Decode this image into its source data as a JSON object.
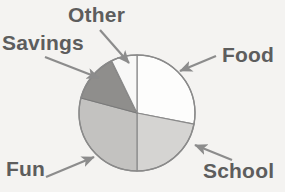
{
  "chart_data": {
    "type": "pie",
    "title": "",
    "subtitle": "",
    "xlabel": "",
    "ylabel": "",
    "grid": false,
    "legend_position": "none",
    "label_style": "external-with-arrows",
    "center": {
      "x": 137,
      "y": 113
    },
    "radius": 58,
    "start_angle_deg": 0,
    "direction": "clockwise",
    "categories": [
      "Food",
      "School",
      "Fun",
      "Savings",
      "Other"
    ],
    "values": [
      28,
      21,
      29,
      14,
      8
    ],
    "unit": "percent",
    "slices": [
      {
        "label": "Food",
        "value": 28,
        "start_angle_deg": 0,
        "end_angle_deg": 101,
        "color": "#fdfdfc",
        "stroke": "#8a8a8a",
        "label_position": "right",
        "arrow": {
          "from_x": 216,
          "from_y": 56,
          "to_x": 180,
          "to_y": 71
        }
      },
      {
        "label": "School",
        "value": 21,
        "start_angle_deg": 101,
        "end_angle_deg": 180,
        "color": "#d5d4d2",
        "stroke": "#8a8a8a",
        "label_position": "bottom-right",
        "arrow": {
          "from_x": 232,
          "from_y": 160,
          "to_x": 195,
          "to_y": 145
        }
      },
      {
        "label": "Fun",
        "value": 29,
        "start_angle_deg": 180,
        "end_angle_deg": 285,
        "color": "#c3c2c0",
        "stroke": "#8a8a8a",
        "label_position": "bottom-left",
        "arrow": {
          "from_x": 46,
          "from_y": 177,
          "to_x": 94,
          "to_y": 157
        }
      },
      {
        "label": "Savings",
        "value": 14,
        "start_angle_deg": 285,
        "end_angle_deg": 334,
        "color": "#8f8e8c",
        "stroke": "#7a7a7a",
        "label_position": "top-left",
        "arrow": {
          "from_x": 45,
          "from_y": 57,
          "to_x": 99,
          "to_y": 78
        }
      },
      {
        "label": "Other",
        "value": 8,
        "start_angle_deg": 334,
        "end_angle_deg": 360,
        "color": "#f8f8f7",
        "stroke": "#8a8a8a",
        "label_position": "top",
        "arrow": {
          "from_x": 100,
          "from_y": 30,
          "to_x": 129,
          "to_y": 63
        }
      }
    ]
  },
  "labels": {
    "other": "Other",
    "savings": "Savings",
    "food": "Food",
    "fun": "Fun",
    "school": "School"
  },
  "colors": {
    "background": "#f4f3f1",
    "text": "#5d5d5d",
    "arrow": "#8c8c8c",
    "pie_outline": "#8a8a8a"
  }
}
